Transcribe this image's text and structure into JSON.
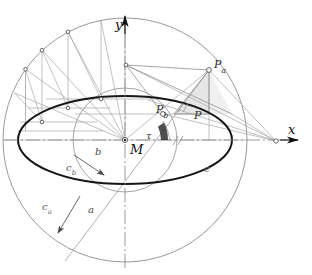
{
  "figure": {
    "kind": "geometric-construction",
    "background": "#ffffff"
  },
  "colors": {
    "ellipse": "#151515",
    "circle": "#8a8a8a",
    "construction": "#9a9a9a",
    "axis": "#8f8f8f",
    "axis_arrow": "#111111",
    "shade": "#d9d9d9",
    "label": "#2e2e2e"
  },
  "axes": {
    "x_label": "x",
    "y_label": "y",
    "origin_label": "M"
  },
  "points": [
    {
      "id": "M",
      "label": "M",
      "sub": "",
      "x": 125,
      "y": 140
    },
    {
      "id": "Pa",
      "label": "P",
      "sub": "a",
      "x": 209,
      "y": 70
    },
    {
      "id": "Pb",
      "label": "P",
      "sub": "b",
      "x": 163,
      "y": 114
    },
    {
      "id": "P",
      "label": "P",
      "sub": "",
      "x": 209,
      "y": 114
    }
  ],
  "curves": [
    {
      "id": "ca",
      "label": "c",
      "sub": "a",
      "role": "major-circle",
      "cx": 125,
      "cy": 140,
      "r": 122
    },
    {
      "id": "cb",
      "label": "c",
      "sub": "b",
      "role": "minor-circle",
      "cx": 125,
      "cy": 140,
      "r": 52
    },
    {
      "id": "c",
      "label": "c",
      "sub": "",
      "role": "ellipse",
      "cx": 125,
      "cy": 140,
      "rx": 107,
      "ry": 44
    }
  ],
  "radii": [
    {
      "id": "a",
      "label": "a",
      "note": "semi-major axis arrow"
    },
    {
      "id": "b",
      "label": "b",
      "note": "semi-minor axis arrow"
    }
  ],
  "angle": {
    "label": "τ",
    "name": "tau",
    "vertex": "M",
    "degrees": 24
  },
  "tick_marks": [
    {
      "id": "hatch-upper",
      "style": "double-slash"
    },
    {
      "id": "hatch-lower",
      "style": "double-slash"
    }
  ],
  "labels": {
    "x_axis": "x",
    "y_axis": "y",
    "center": "M",
    "point_Pa_base": "P",
    "point_Pa_sub": "a",
    "point_Pb_base": "P",
    "point_Pb_sub": "b",
    "point_P": "P",
    "ellipse_c": "c",
    "circle_ca_base": "c",
    "circle_ca_sub": "a",
    "circle_cb_base": "c",
    "circle_cb_sub": "b",
    "radius_a": "a",
    "radius_b": "b",
    "angle_tau": "τ"
  }
}
